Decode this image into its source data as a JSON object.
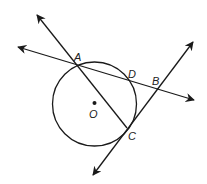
{
  "diagram": {
    "type": "geometry",
    "circle": {
      "center_label": "O",
      "cx": 94.5,
      "cy": 104,
      "r": 42
    },
    "points": [
      {
        "id": "A",
        "label": "A",
        "x": 76,
        "y": 65,
        "lx": 74,
        "ly": 61
      },
      {
        "id": "D",
        "label": "D",
        "x": 131,
        "y": 80,
        "lx": 128,
        "ly": 78
      },
      {
        "id": "B",
        "label": "B",
        "x": 158,
        "y": 89,
        "lx": 152,
        "ly": 85
      },
      {
        "id": "C",
        "label": "C",
        "x": 127,
        "y": 128,
        "lx": 128,
        "ly": 140
      },
      {
        "id": "O",
        "label": "O",
        "x": 94.5,
        "y": 103,
        "lx": 89,
        "ly": 118
      }
    ],
    "lines": [
      {
        "name": "line-AC",
        "through": [
          "A",
          "C"
        ],
        "x1": 37,
        "y1": 15,
        "x2": 127,
        "y2": 128,
        "arrow_start": true,
        "arrow_end": false
      },
      {
        "name": "line-AB",
        "through": [
          "A",
          "D",
          "B"
        ],
        "x1": 18,
        "y1": 47,
        "x2": 194,
        "y2": 100,
        "arrow_start": true,
        "arrow_end": true
      },
      {
        "name": "line-CB",
        "through": [
          "C",
          "B"
        ],
        "x1": 93,
        "y1": 175,
        "x2": 193,
        "y2": 42,
        "arrow_start": true,
        "arrow_end": true
      }
    ],
    "stroke_color": "#1a1a1a"
  }
}
